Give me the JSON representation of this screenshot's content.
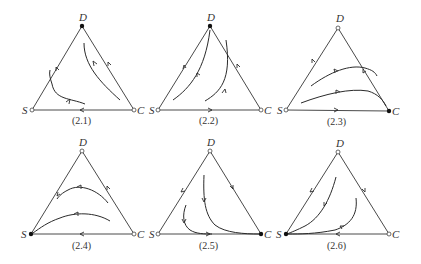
{
  "figure": {
    "panels": [
      {
        "caption": "(2.1)",
        "fill": "#ebebeb",
        "vertex_labels": {
          "top": "D",
          "left": "S",
          "right": "C"
        },
        "stable_vertex": "D",
        "edge_flows": {
          "S_to_D": "toward D",
          "C_to_D": "toward D",
          "C_to_S": "toward S"
        }
      },
      {
        "caption": "(2.2)",
        "fill": "#ebebeb",
        "vertex_labels": {
          "top": "D",
          "left": "S",
          "right": "C"
        },
        "stable_vertex": "D",
        "edge_flows": {
          "S_to_D": "toward D",
          "C_to_D": "toward D",
          "S_to_C": "toward C"
        }
      },
      {
        "caption": "(2.3)",
        "fill": "#b3b3b3",
        "vertex_labels": {
          "top": "D",
          "left": "S",
          "right": "C"
        },
        "stable_vertex": "C",
        "edge_flows": {
          "S_to_D": "toward D",
          "D_to_C": "toward C",
          "S_to_C": "toward C"
        }
      },
      {
        "caption": "(2.4)",
        "fill": "#939393",
        "vertex_labels": {
          "top": "D",
          "left": "S",
          "right": "C"
        },
        "stable_vertex": "S",
        "edge_flows": {
          "D_to_S": "toward S",
          "C_to_D": "toward D",
          "C_to_S": "toward S"
        }
      },
      {
        "caption": "(2.5)",
        "fill": "#a9a9a9",
        "vertex_labels": {
          "top": "D",
          "left": "S",
          "right": "C"
        },
        "stable_vertex": "C",
        "edge_flows": {
          "D_to_S": "toward S",
          "D_to_C": "toward C",
          "S_to_C": "toward C"
        }
      },
      {
        "caption": "(2.6)",
        "fill": "#939393",
        "vertex_labels": {
          "top": "D",
          "left": "S",
          "right": "C"
        },
        "stable_vertex": "S",
        "edge_flows": {
          "D_to_S": "toward S",
          "D_to_C": "toward C",
          "C_to_S": "toward S"
        }
      }
    ]
  }
}
